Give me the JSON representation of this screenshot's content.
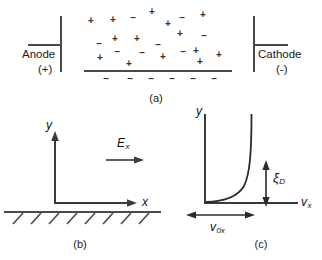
{
  "figure": {
    "type": "scientific-diagram",
    "ink_color": "#4a4a4a",
    "text_color": "#1a1a1a"
  },
  "panel_a": {
    "label": "(a)",
    "anode": {
      "name": "Anode",
      "polarity": "(+)"
    },
    "cathode": {
      "name": "Cathode",
      "polarity": "(-)"
    },
    "positive_symbol": "+",
    "negative_symbol": "–",
    "bulk_charges": [
      {
        "s": "+",
        "x": 91,
        "y": 21
      },
      {
        "s": "+",
        "x": 113,
        "y": 20
      },
      {
        "s": "-",
        "x": 133,
        "y": 18
      },
      {
        "s": "+",
        "x": 152,
        "y": 12
      },
      {
        "s": "+",
        "x": 168,
        "y": 24
      },
      {
        "s": "-",
        "x": 182,
        "y": 18
      },
      {
        "s": "+",
        "x": 203,
        "y": 15
      },
      {
        "s": "-",
        "x": 99,
        "y": 44
      },
      {
        "s": "+",
        "x": 115,
        "y": 39
      },
      {
        "s": "+",
        "x": 137,
        "y": 39
      },
      {
        "s": "-",
        "x": 158,
        "y": 45
      },
      {
        "s": "+",
        "x": 180,
        "y": 34
      },
      {
        "s": "-",
        "x": 204,
        "y": 36
      },
      {
        "s": "+",
        "x": 100,
        "y": 58
      },
      {
        "s": "-",
        "x": 117,
        "y": 52
      },
      {
        "s": "-",
        "x": 142,
        "y": 53
      },
      {
        "s": "+",
        "x": 163,
        "y": 57
      },
      {
        "s": "-",
        "x": 183,
        "y": 52
      },
      {
        "s": "+",
        "x": 196,
        "y": 51
      },
      {
        "s": "+",
        "x": 219,
        "y": 55
      },
      {
        "s": "+",
        "x": 129,
        "y": 64
      },
      {
        "s": "+",
        "x": 200,
        "y": 62
      }
    ],
    "surface_negative_row": [
      {
        "s": "-",
        "x": 106,
        "y": 79
      },
      {
        "s": "-",
        "x": 130,
        "y": 79
      },
      {
        "s": "-",
        "x": 151,
        "y": 79
      },
      {
        "s": "-",
        "x": 172,
        "y": 79
      },
      {
        "s": "-",
        "x": 193,
        "y": 79
      },
      {
        "s": "-",
        "x": 214,
        "y": 79
      }
    ]
  },
  "panel_b": {
    "label": "(b)",
    "y_axis_label": "y",
    "x_axis_label": "x",
    "field_label": "E",
    "field_subscript": "x",
    "hatch_count": 8
  },
  "panel_c": {
    "label": "(c)",
    "y_axis_label": "y",
    "x_axis_label": "v",
    "x_axis_subscript": "x",
    "debye_label": "ξ",
    "debye_subscript": "D",
    "velocity_label": "v",
    "velocity_subscript": "0x"
  }
}
